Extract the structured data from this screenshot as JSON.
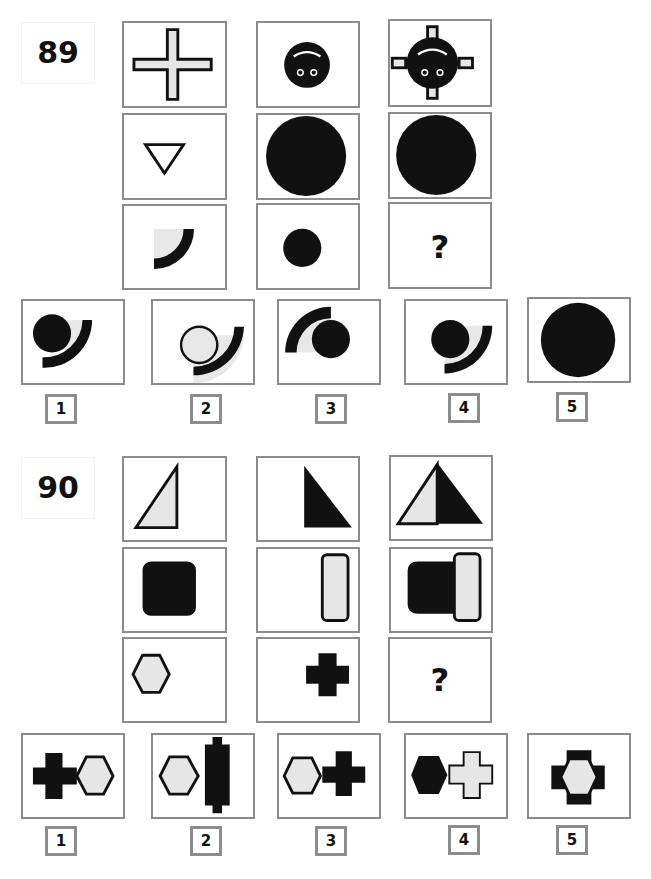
{
  "colors": {
    "fill_black": "#111111",
    "fill_light": "#e6e6e6",
    "border": "#8c8c8c"
  },
  "puzzles": [
    {
      "number": "89",
      "grid": [
        [
          "cross-outline",
          "black-circle-face",
          "black-circle-face-with-cross-arms"
        ],
        [
          "triangle-down-outline",
          "large-black-circle",
          "large-black-circle"
        ],
        [
          "quarter-arc-with-light-fill",
          "small-black-circle",
          "?"
        ]
      ],
      "missing_symbol": "?",
      "options": [
        {
          "label": "1",
          "shape": "black-circle-upper-left-of-arc"
        },
        {
          "label": "2",
          "shape": "outlined-circle-inside-arc"
        },
        {
          "label": "3",
          "shape": "black-circle-under-flipped-arc"
        },
        {
          "label": "4",
          "shape": "black-circle-inside-arc"
        },
        {
          "label": "5",
          "shape": "large-black-circle"
        }
      ]
    },
    {
      "number": "90",
      "grid": [
        [
          "light-right-triangle-left",
          "black-right-triangle-right",
          "combined-triangle"
        ],
        [
          "black-rounded-square",
          "light-rounded-bar",
          "black-square-with-light-bar"
        ],
        [
          "light-hexagon",
          "black-plus",
          "?"
        ]
      ],
      "missing_symbol": "?",
      "options": [
        {
          "label": "1",
          "shape": "black-plus-left-light-hexagon-right"
        },
        {
          "label": "2",
          "shape": "light-hexagon-with-tall-black-bar"
        },
        {
          "label": "3",
          "shape": "light-hexagon-left-black-plus-right"
        },
        {
          "label": "4",
          "shape": "black-hexagon-left-light-plus-right"
        },
        {
          "label": "5",
          "shape": "light-hexagon-over-black-plus"
        }
      ]
    }
  ]
}
